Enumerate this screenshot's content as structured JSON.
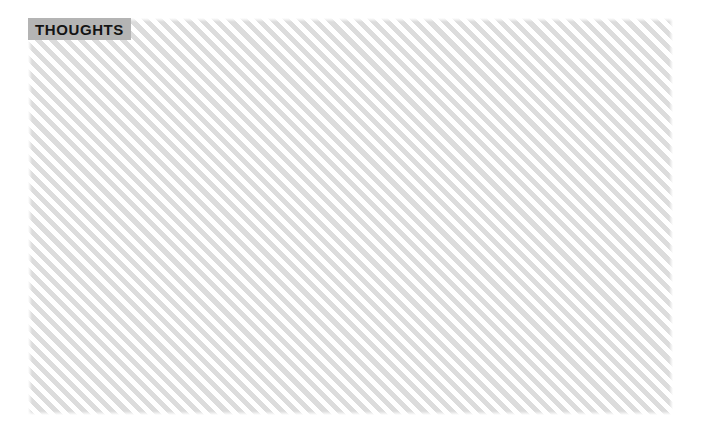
{
  "screen": {
    "width": 701,
    "height": 433,
    "background_color": "#ffffff"
  },
  "panel": {
    "label": "THOUGHTS",
    "label_background_color": "#b4b4b4",
    "label_text_color": "#141414",
    "content": "",
    "state": "empty",
    "hatch_stripe_color": "#dcdcdc",
    "hatch_gap_color": "#ffffff",
    "hatch_angle_degrees": 45,
    "hatch_period_px": 10
  }
}
